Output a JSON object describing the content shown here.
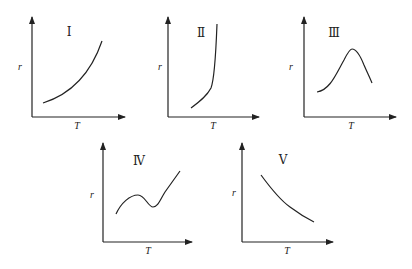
{
  "diagram": {
    "axis_labels": {
      "x": "T",
      "y": "r"
    },
    "panels": [
      {
        "id": "I",
        "label": "Ⅰ",
        "shape": "increasing, concave up (exponential-like)"
      },
      {
        "id": "II",
        "label": "Ⅱ",
        "shape": "slow rise then sudden near-vertical increase (explosion)"
      },
      {
        "id": "III",
        "label": "Ⅲ",
        "shape": "rises to a maximum then falls (enzyme-like)"
      },
      {
        "id": "IV",
        "label": "Ⅳ",
        "shape": "rises, dips to a local minimum, then rises again"
      },
      {
        "id": "V",
        "label": "Ⅴ",
        "shape": "decreasing with T"
      }
    ]
  }
}
